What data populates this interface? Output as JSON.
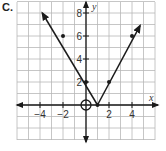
{
  "choice": {
    "label": "C."
  },
  "chart_data": {
    "type": "line",
    "title": "",
    "xlabel": "x",
    "ylabel": "y",
    "xlim": [
      -6,
      6
    ],
    "ylim": [
      -3,
      9
    ],
    "grid": true,
    "x_tick_labels": [
      "-4",
      "-2",
      "2",
      "4"
    ],
    "y_tick_labels": [
      "2",
      "4",
      "6",
      "8"
    ],
    "function": "y = |2x - 2|",
    "series": [
      {
        "name": "V-shaped absolute value graph",
        "points": [
          [
            -4,
            10
          ],
          [
            -2,
            6
          ],
          [
            0,
            2
          ],
          [
            1,
            0
          ],
          [
            2,
            2
          ],
          [
            4,
            6
          ],
          [
            4.7,
            7.4
          ]
        ],
        "marked_points": [
          [
            -2,
            6
          ],
          [
            0,
            2
          ],
          [
            1,
            0
          ],
          [
            2,
            2
          ],
          [
            4,
            6
          ]
        ],
        "arrows": "both ends"
      }
    ],
    "annotations": [
      {
        "type": "open-circle",
        "at": [
          0,
          0
        ]
      }
    ]
  },
  "colors": {
    "line": "#1a1a1a",
    "grid": "#b8b8b8",
    "axis": "#1a1a1a"
  }
}
